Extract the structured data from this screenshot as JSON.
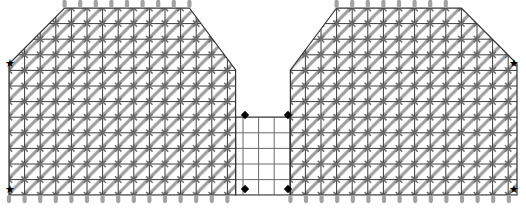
{
  "figure": {
    "title": "",
    "type": "finite-element-mesh",
    "width": 526,
    "height": 213
  },
  "colors": {
    "background": "#ffffff",
    "grid_line": "#3a3a3a",
    "hatch": "#9a9a9a",
    "node_cross": "#777777",
    "support_marker": "#9d9d9d",
    "star_marker": "#000000",
    "diamond_marker": "#000000",
    "outline": "#333333"
  },
  "mesh": {
    "cell_size": 15.6,
    "origin_x": 9,
    "origin_y": 8,
    "cols": 33,
    "rows": 12,
    "hatch_angle_deg": 45,
    "hatch_spacing": 15.6,
    "notch": {
      "label": "center-notch",
      "col_start": 15,
      "col_end": 18,
      "row_start": 0,
      "row_end": 6,
      "hatched": false
    },
    "bevels": [
      {
        "label": "top-left-bevel",
        "corner": "top-left"
      },
      {
        "label": "top-right-bevel",
        "corner": "top-right"
      }
    ]
  },
  "markers": {
    "stars": [
      {
        "name": "star-top-left",
        "x": 10,
        "y": 64
      },
      {
        "name": "star-bottom-left",
        "x": 10,
        "y": 190
      },
      {
        "name": "star-top-right",
        "x": 514,
        "y": 64
      },
      {
        "name": "star-bottom-right",
        "x": 514,
        "y": 190
      }
    ],
    "diamonds": [
      {
        "name": "diamond-notch-top-left",
        "x": 245,
        "y": 115
      },
      {
        "name": "diamond-notch-top-right",
        "x": 288,
        "y": 115
      },
      {
        "name": "diamond-notch-bottom-left",
        "x": 245,
        "y": 189
      },
      {
        "name": "diamond-notch-bottom-right",
        "x": 288,
        "y": 189
      }
    ],
    "support_edges": [
      "top",
      "bottom"
    ],
    "support_count_top": 22,
    "support_count_bottom": 32
  },
  "legend": {
    "star_label": "star-marker",
    "diamond_label": "diamond-marker",
    "support_label": "support-marker"
  }
}
